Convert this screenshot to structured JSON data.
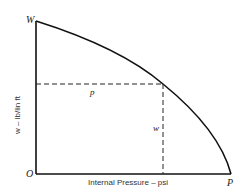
{
  "diagram": {
    "labels": {
      "top_y": "W",
      "origin": "O",
      "end_x": "P",
      "horizontal_dashed": "p",
      "vertical_dashed": "w"
    },
    "axes": {
      "xlabel": "Internal Pressure – psi",
      "ylabel": "w – lb/lin ft"
    },
    "colors": {
      "line": "#111111",
      "text": "#222222",
      "background": "#ffffff"
    }
  }
}
